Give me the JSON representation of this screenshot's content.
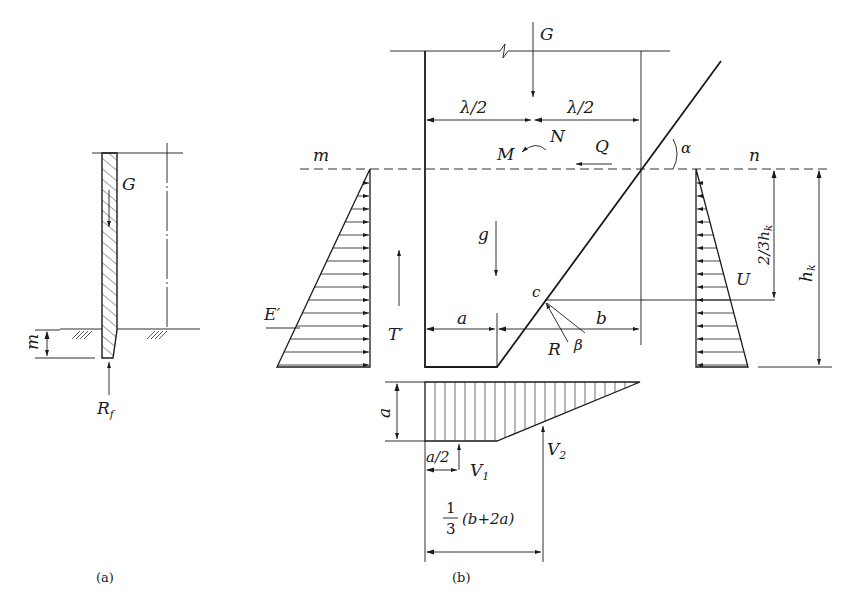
{
  "figure_a": {
    "caption": "(a)",
    "labels": {
      "G": "G",
      "m": "m",
      "R": "R",
      "R_sub": "f"
    }
  },
  "figure_b": {
    "caption": "(b)",
    "labels": {
      "G": "G",
      "half_lambda_left": "λ/2",
      "half_lambda_right": "λ/2",
      "M": "M",
      "N": "N",
      "Q": "Q",
      "alpha": "α",
      "m": "m",
      "n": "n",
      "g": "g",
      "E_prime": "E′",
      "T_prime": "T′",
      "c": "c",
      "a": "a",
      "b": "b",
      "R": "R",
      "beta": "β",
      "U": "U",
      "two_thirds_hk": "2/3h",
      "two_thirds_hk_sub": "k",
      "hk": "h",
      "hk_sub": "k",
      "a_vertical": "a",
      "a_half": "a/2",
      "V1": "V",
      "V1_sub": "1",
      "V2": "V",
      "V2_sub": "2",
      "frac_num": "1",
      "frac_den": "3",
      "frac_expr": "(b+2a)"
    }
  }
}
